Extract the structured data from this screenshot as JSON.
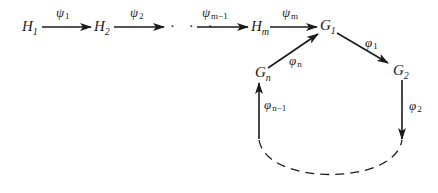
{
  "diagram": {
    "type": "commutative-diagram",
    "nodes": [
      {
        "id": "H1",
        "base": "H",
        "sub": "1"
      },
      {
        "id": "H2",
        "base": "H",
        "sub": "2"
      },
      {
        "id": "Hm",
        "base": "H",
        "sub": "m"
      },
      {
        "id": "G1",
        "base": "G",
        "sub": "1"
      },
      {
        "id": "G2",
        "base": "G",
        "sub": "2"
      },
      {
        "id": "Gn",
        "base": "G",
        "sub": "n"
      }
    ],
    "ellipsis": "· · ·",
    "edges": [
      {
        "from": "H1",
        "to": "H2",
        "base": "ψ",
        "sub": "1"
      },
      {
        "from": "H2",
        "to": "…",
        "base": "ψ",
        "sub": "2"
      },
      {
        "from": "…",
        "to": "Hm",
        "base": "ψ",
        "sub": "m−1"
      },
      {
        "from": "Hm",
        "to": "G1",
        "base": "ψ",
        "sub": "m"
      },
      {
        "from": "G1",
        "to": "G2",
        "base": "φ",
        "sub": "1"
      },
      {
        "from": "G2",
        "to": "…",
        "base": "φ",
        "sub": "2"
      },
      {
        "from": "…",
        "to": "Gn",
        "base": "φ",
        "sub": "n−1"
      },
      {
        "from": "Gn",
        "to": "G1",
        "base": "φ",
        "sub": "n"
      }
    ],
    "dashed_arc": "continuation of cycle G2 → … → Gn"
  }
}
